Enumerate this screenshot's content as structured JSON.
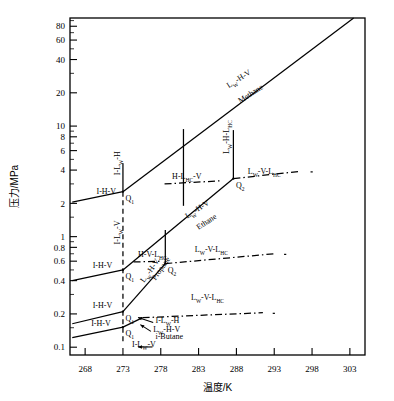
{
  "chart_data": {
    "type": "line",
    "title": "",
    "xlabel": "温度/K",
    "ylabel": "压力/MPa",
    "xlim": [
      266,
      305
    ],
    "ylim": [
      0.085,
      95
    ],
    "yscale": "log",
    "xscale": "linear",
    "grid": false,
    "legend": "none",
    "xticks": [
      268,
      273,
      278,
      283,
      288,
      293,
      298,
      303
    ],
    "yticks": [
      0.1,
      0.2,
      0.4,
      0.6,
      0.8,
      1,
      2,
      4,
      6,
      8,
      10,
      20,
      40,
      60,
      80
    ],
    "ytick_labels": [
      "0.1",
      "0.2",
      "0.4",
      "0.6",
      "0.8",
      "1",
      "2",
      "4",
      "6",
      "8",
      "10",
      "20",
      "40",
      "60",
      "80"
    ],
    "xtick_labels": [
      "268",
      "273",
      "278",
      "283",
      "288",
      "293",
      "298",
      "303"
    ],
    "series": [
      {
        "name": "Methane I-H-V",
        "style": "solid",
        "points": [
          [
            266.3,
            2.05
          ],
          [
            273.0,
            2.55
          ]
        ]
      },
      {
        "name": "Methane Lw-H-V",
        "style": "solid",
        "points": [
          [
            273.0,
            2.55
          ],
          [
            303.5,
            95.0
          ]
        ]
      },
      {
        "name": "Methane I-Lw-H vertical",
        "style": "solid",
        "points": [
          [
            273.0,
            2.55
          ],
          [
            273.0,
            4.6
          ]
        ]
      },
      {
        "name": "Methane I-Lw-V vertical dashed",
        "style": "dashed",
        "points": [
          [
            273.0,
            2.55
          ],
          [
            273.0,
            0.11
          ]
        ]
      },
      {
        "name": "Ethane I-H-V",
        "style": "solid",
        "points": [
          [
            266.3,
            0.4
          ],
          [
            273.0,
            0.5
          ]
        ]
      },
      {
        "name": "Ethane Lw-H-V",
        "style": "solid",
        "points": [
          [
            273.0,
            0.5
          ],
          [
            287.6,
            3.35
          ]
        ]
      },
      {
        "name": "Ethane Lw-H-LHC vertical",
        "style": "solid",
        "points": [
          [
            287.6,
            3.35
          ],
          [
            287.6,
            9.2
          ]
        ]
      },
      {
        "name": "Ethane Lw-V-LHC",
        "style": "dashdot",
        "points": [
          [
            287.6,
            3.35
          ],
          [
            296.5,
            3.9
          ]
        ]
      },
      {
        "name": "Ethane H-LHC-V",
        "style": "dashdot",
        "points": [
          [
            278.5,
            3.0
          ],
          [
            286.0,
            3.2
          ]
        ]
      },
      {
        "name": "Propane I-H-V",
        "style": "solid",
        "points": [
          [
            266.3,
            0.163
          ],
          [
            273.0,
            0.21
          ]
        ]
      },
      {
        "name": "Propane Lw-H-V",
        "style": "solid",
        "points": [
          [
            273.0,
            0.21
          ],
          [
            278.6,
            0.57
          ]
        ]
      },
      {
        "name": "Propane Lw-H-LHC vertical",
        "style": "solid",
        "points": [
          [
            278.6,
            0.57
          ],
          [
            278.6,
            1.15
          ]
        ]
      },
      {
        "name": "Propane Lw-V-LHC",
        "style": "dashdot",
        "points": [
          [
            278.6,
            0.57
          ],
          [
            293.0,
            0.7
          ]
        ]
      },
      {
        "name": "Propane H-V-LHC",
        "style": "dashdot",
        "points": [
          [
            274.4,
            0.59
          ],
          [
            278.2,
            0.6
          ]
        ]
      },
      {
        "name": "i-Butane I-H-V",
        "style": "solid",
        "points": [
          [
            266.3,
            0.122
          ],
          [
            273.0,
            0.152
          ]
        ]
      },
      {
        "name": "i-Butane Lw-H-V",
        "style": "solid",
        "points": [
          [
            273.0,
            0.152
          ],
          [
            275.6,
            0.185
          ]
        ]
      },
      {
        "name": "i-Butane Lw-V-LHC",
        "style": "dashdot",
        "points": [
          [
            275.6,
            0.185
          ],
          [
            291.5,
            0.205
          ]
        ]
      },
      {
        "name": "Methane upper boundary segment",
        "style": "solid",
        "points": [
          [
            281.0,
            9.4
          ],
          [
            281.0,
            1.9
          ]
        ]
      }
    ],
    "quadruple_points": [
      {
        "label": "Q1",
        "sub": "1",
        "x": 273.0,
        "y": 2.55,
        "substance": "Methane"
      },
      {
        "label": "Q2",
        "sub": "2",
        "x": 287.6,
        "y": 3.35,
        "substance": "Ethane"
      },
      {
        "label": "Q1",
        "sub": "1",
        "x": 273.0,
        "y": 0.5,
        "substance": "Ethane"
      },
      {
        "label": "Q2",
        "sub": "2",
        "x": 278.6,
        "y": 0.57,
        "substance": "Propane"
      },
      {
        "label": "Q1",
        "sub": "1",
        "x": 273.0,
        "y": 0.21,
        "substance": "Propane"
      },
      {
        "label": "Q1",
        "sub": "1",
        "x": 273.0,
        "y": 0.152,
        "substance": "i-Butane"
      }
    ],
    "annotations": [
      {
        "text": "I-H-V",
        "x": 269.5,
        "y": 2.45,
        "rotation": 0,
        "name": "methane-i-h-v"
      },
      {
        "text": "I-Lw-H",
        "x": 272.6,
        "y": 3.6,
        "rotation": -90,
        "name": "methane-i-lw-h"
      },
      {
        "text": "I-Lw-V",
        "x": 272.6,
        "y": 0.85,
        "rotation": -90,
        "name": "methane-i-lw-v"
      },
      {
        "text": "Lw-H-V",
        "x": 287.0,
        "y": 22.0,
        "rotation": -33,
        "name": "methane-lw-h-v"
      },
      {
        "text": "Methane",
        "x": 288.5,
        "y": 16.0,
        "rotation": -33,
        "name": "methane-name"
      },
      {
        "text": "Lw-H-LHC",
        "x": 287.0,
        "y": 5.6,
        "rotation": -90,
        "name": "ethane-lw-h-lhc"
      },
      {
        "text": "Lw-V-LHC",
        "x": 289.5,
        "y": 3.7,
        "rotation": 0,
        "name": "ethane-lw-v-lhc"
      },
      {
        "text": "H-LHC-V",
        "x": 279.5,
        "y": 3.3,
        "rotation": 0,
        "name": "ethane-h-lhc-v"
      },
      {
        "text": "Lw-H-V",
        "x": 281.5,
        "y": 1.45,
        "rotation": -33,
        "name": "ethane-lw-h-v"
      },
      {
        "text": "Ethane",
        "x": 283.0,
        "y": 1.15,
        "rotation": -33,
        "name": "ethane-name"
      },
      {
        "text": "I-H-V",
        "x": 269.0,
        "y": 0.52,
        "rotation": 0,
        "name": "ethane-i-h-v"
      },
      {
        "text": "H-V-LHC",
        "x": 275.0,
        "y": 0.66,
        "rotation": 0,
        "name": "propane-h-v-lhc"
      },
      {
        "text": "Lw-H-V",
        "x": 275.8,
        "y": 0.38,
        "rotation": -55,
        "name": "propane-lw-h-v"
      },
      {
        "text": "Propane",
        "x": 277.3,
        "y": 0.4,
        "rotation": -55,
        "name": "propane-name"
      },
      {
        "text": "Lw-V-LHC",
        "x": 282.5,
        "y": 0.73,
        "rotation": 0,
        "name": "propane-lw-v-lhc"
      },
      {
        "text": "I-H-V",
        "x": 269.0,
        "y": 0.225,
        "rotation": 0,
        "name": "propane-i-h-v"
      },
      {
        "text": "Lw-V-LHC",
        "x": 282.0,
        "y": 0.27,
        "rotation": 0,
        "name": "ibutane-lw-v-lhc"
      },
      {
        "text": "I-Lw-H",
        "x": 277.3,
        "y": 0.165,
        "rotation": 0,
        "name": "ibutane-i-lw-h"
      },
      {
        "text": "Lw-H-V",
        "x": 277.0,
        "y": 0.138,
        "rotation": 0,
        "name": "ibutane-lw-h-v"
      },
      {
        "text": "i-Butane",
        "x": 277.3,
        "y": 0.118,
        "rotation": 0,
        "name": "ibutane-name"
      },
      {
        "text": "I-Lw-V",
        "x": 274.2,
        "y": 0.1,
        "rotation": 0,
        "name": "ibutane-i-lw-v"
      },
      {
        "text": "I-H-V",
        "x": 268.8,
        "y": 0.157,
        "rotation": 0,
        "name": "ibutane-i-h-v"
      }
    ]
  },
  "axes": {
    "x_title": "温度/K",
    "y_title": "压力/MPa",
    "x_ticks": [
      "268",
      "273",
      "278",
      "283",
      "288",
      "293",
      "298",
      "303"
    ],
    "y_ticks": [
      "80",
      "60",
      "40",
      "20",
      "10",
      "8",
      "6",
      "4",
      "2",
      "1",
      "0.8",
      "0.6",
      "0.4",
      "0.2",
      "0.1"
    ]
  },
  "labels": {
    "methane": "Methane",
    "ethane": "Ethane",
    "propane": "Propane",
    "ibutane": "i-Butane",
    "ihv": "I-H-V",
    "ilwh": "I-L",
    "ilwv": "I-L",
    "lwhv": "L",
    "lwvlhc": "L",
    "hlhcv": "H-L",
    "hvlhc": "H-V-L",
    "lwhlhc": "L",
    "q1": "Q",
    "q2": "Q",
    "sub_w": "W",
    "sub_hc": "HC",
    "sub_1": "1",
    "sub_2": "2"
  },
  "colors": {
    "line": "#000000",
    "background": "#ffffff",
    "text": "#000000"
  }
}
